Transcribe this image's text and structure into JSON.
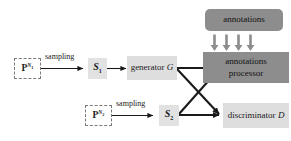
{
  "diagram": {
    "canvas": {
      "width": 291,
      "height": 141,
      "background": "#ffffff"
    },
    "colors": {
      "dark_box": "#8d8d8d",
      "light_box": "#dedede",
      "s_box": "#e2e2e2",
      "stroke": "#1a1a1a",
      "dashed_border": "#7a7a7a"
    },
    "nodes": {
      "source_1": {
        "label": "P",
        "superscript": "N",
        "subscript": "1",
        "style": "dashed"
      },
      "source_2": {
        "label": "P",
        "superscript": "N",
        "subscript": "2",
        "style": "dashed"
      },
      "sample_1": {
        "label": "S",
        "subscript": "1"
      },
      "sample_2": {
        "label": "S",
        "subscript": "2"
      },
      "generator": {
        "prefix": "generator",
        "symbol": "G"
      },
      "discriminator": {
        "prefix": "discriminator",
        "symbol": "D"
      },
      "annotations": {
        "label": "annotations"
      },
      "annotations_processor": {
        "line1": "annotations",
        "line2": "processor"
      }
    },
    "edges": {
      "sampling_1_label": "sampling",
      "sampling_2_label": "sampling",
      "annotation_feed_arrow_count": 4
    }
  }
}
